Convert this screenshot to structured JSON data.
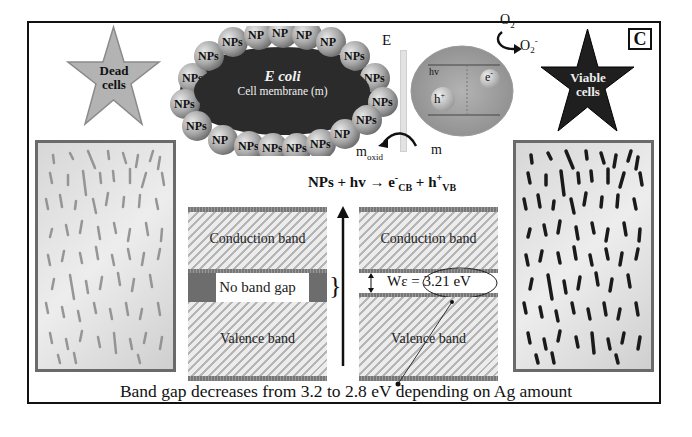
{
  "figure": {
    "panel_label": "C",
    "caption": "Band gap decreases from 3.2 to 2.8 eV depending on Ag amount"
  },
  "stars": {
    "dead": {
      "line1": "Dead",
      "line2": "cells",
      "color": "#b0b0b0"
    },
    "viable": {
      "line1": "Viable",
      "line2": "cells",
      "color": "#1e1e1e"
    }
  },
  "bacterium": {
    "title": "E coli",
    "subtitle": "Cell membrane (m)",
    "np_label": "NPs",
    "np_count": 20
  },
  "photocatalysis": {
    "energy_axis": "E",
    "hv": "hv",
    "hole": "h+",
    "electron": "e-",
    "o2": "O2",
    "superoxide": "O2-",
    "m_oxid": "m",
    "m_oxid_sub": "oxid",
    "m": "m"
  },
  "equation": {
    "lhs": "NPs + hv",
    "arrow": "→",
    "e": "e",
    "e_sup": "-",
    "e_sub": "CB",
    "plus": "+",
    "h": "h",
    "h_sup": "+",
    "h_sub": "VB"
  },
  "band_left": {
    "conduction": "Conduction band",
    "gap": "No band gap",
    "valence": "Valence band"
  },
  "band_right": {
    "conduction": "Conduction band",
    "gap_symbol": "Wε",
    "gap_value": "= 3.21 eV",
    "valence": "Valence band"
  },
  "colors": {
    "frame": "#111111",
    "hatch_dark": "#b5b5b5",
    "hatch_light": "#ececec",
    "membrane": "#2a2a2a",
    "np_sphere": "#a8a8a8"
  }
}
